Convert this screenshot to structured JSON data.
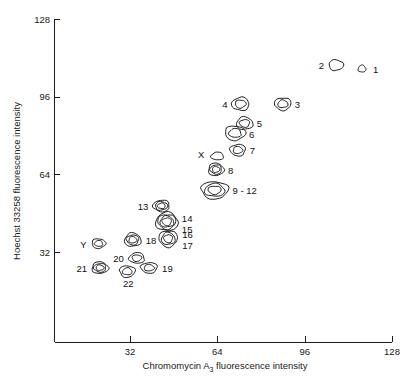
{
  "figure": {
    "kind": "bivariate-flow-karyotype",
    "background": "#ffffff",
    "ink_color": "#141414"
  },
  "chart_data": {
    "type": "scatter",
    "title": "",
    "subtitle": "",
    "xlabel_prefix": "Chromomycin A",
    "xlabel_sub": "3",
    "xlabel_suffix": " fluorescence intensity",
    "xlabel": "Chromomycin A3 fluorescence intensity",
    "ylabel": "Hoechst 33258 fluorescence intensity",
    "grid": false,
    "legend": "none",
    "xlim": [
      0,
      128
    ],
    "ylim": [
      0,
      128
    ],
    "xticks": [
      32,
      64,
      96,
      128
    ],
    "yticks": [
      32,
      64,
      96,
      128
    ],
    "xtick_labels": [
      "32",
      "64",
      "96",
      "128"
    ],
    "ytick_labels": [
      "32",
      "64",
      "96",
      "128"
    ],
    "x_axis_start_value": 5.5,
    "y_axis_start_value": 3.0,
    "point_encoding": "closed contour rings around each chromosome cluster peak",
    "points": [
      {
        "id": "1",
        "label": "1",
        "x": 117.0,
        "y": 107.5,
        "rings": 1,
        "rx": 4.0,
        "ry": 3.6,
        "label_dx": 11,
        "label_dy": 4,
        "label_anchor": "start"
      },
      {
        "id": "2",
        "label": "2",
        "x": 107.5,
        "y": 109.0,
        "rings": 1,
        "rx": 7.5,
        "ry": 5.5,
        "label_dx": -12,
        "label_dy": 4,
        "label_anchor": "end"
      },
      {
        "id": "3",
        "label": "3",
        "x": 88.0,
        "y": 93.0,
        "rings": 2,
        "rx": 8.5,
        "ry": 6.5,
        "label_dx": 12,
        "label_dy": 4,
        "label_anchor": "start"
      },
      {
        "id": "4",
        "label": "4",
        "x": 72.5,
        "y": 93.0,
        "rings": 2,
        "rx": 9.0,
        "ry": 6.8,
        "label_dx": -13,
        "label_dy": 4,
        "label_anchor": "end"
      },
      {
        "id": "5",
        "label": "5",
        "x": 74.0,
        "y": 85.0,
        "rings": 2,
        "rx": 8.5,
        "ry": 6.5,
        "label_dx": 12,
        "label_dy": 4,
        "label_anchor": "start"
      },
      {
        "id": "6",
        "label": "6",
        "x": 70.5,
        "y": 81.0,
        "rings": 2,
        "rx": 10.5,
        "ry": 7.5,
        "label_dx": 14,
        "label_dy": 5,
        "label_anchor": "start"
      },
      {
        "id": "7",
        "label": "7",
        "x": 71.5,
        "y": 74.0,
        "rings": 2,
        "rx": 8.0,
        "ry": 6.0,
        "label_dx": 12,
        "label_dy": 4,
        "label_anchor": "start"
      },
      {
        "id": "X",
        "label": "X",
        "x": 64.0,
        "y": 71.5,
        "rings": 1,
        "rx": 6.5,
        "ry": 4.0,
        "label_dx": -13,
        "label_dy": 2,
        "label_anchor": "end"
      },
      {
        "id": "8",
        "label": "8",
        "x": 63.5,
        "y": 66.0,
        "rings": 3,
        "rx": 8.0,
        "ry": 6.5,
        "label_dx": 12,
        "label_dy": 5,
        "label_anchor": "start"
      },
      {
        "id": "9-12",
        "label": "9 - 12",
        "x": 63.0,
        "y": 57.5,
        "rings": 3,
        "rx": 14.0,
        "ry": 9.0,
        "label_dx": 18,
        "label_dy": 4,
        "label_anchor": "start"
      },
      {
        "id": "13",
        "label": "13",
        "x": 43.5,
        "y": 51.0,
        "rings": 3,
        "rx": 8.5,
        "ry": 6.0,
        "label_dx": -13,
        "label_dy": 4,
        "label_anchor": "end"
      },
      {
        "id": "14",
        "label": "14",
        "x": 45.5,
        "y": 44.5,
        "rings": 4,
        "rx": 11.5,
        "ry": 9.5,
        "label_dx": 15,
        "label_dy": 0,
        "label_anchor": "start"
      },
      {
        "id": "15",
        "label": "15",
        "x": 45.5,
        "y": 44.5,
        "rings": 0,
        "rx": 0,
        "ry": 0,
        "label_dx": 15,
        "label_dy": 11,
        "label_anchor": "start"
      },
      {
        "id": "16",
        "label": "16",
        "x": 46.0,
        "y": 37.5,
        "rings": 3,
        "rx": 9.5,
        "ry": 8.5,
        "label_dx": 14,
        "label_dy": -1,
        "label_anchor": "start"
      },
      {
        "id": "17",
        "label": "17",
        "x": 46.0,
        "y": 37.5,
        "rings": 0,
        "rx": 0,
        "ry": 0,
        "label_dx": 14,
        "label_dy": 10,
        "label_anchor": "start"
      },
      {
        "id": "18",
        "label": "18",
        "x": 33.0,
        "y": 37.0,
        "rings": 3,
        "rx": 8.5,
        "ry": 7.0,
        "label_dx": 13,
        "label_dy": 4,
        "label_anchor": "start"
      },
      {
        "id": "Y",
        "label": "Y",
        "x": 20.5,
        "y": 35.5,
        "rings": 2,
        "rx": 7.0,
        "ry": 5.0,
        "label_dx": -12,
        "label_dy": 4,
        "label_anchor": "end"
      },
      {
        "id": "19",
        "label": "19",
        "x": 39.0,
        "y": 25.5,
        "rings": 2,
        "rx": 8.5,
        "ry": 5.5,
        "label_dx": 13,
        "label_dy": 4,
        "label_anchor": "start"
      },
      {
        "id": "20",
        "label": "20",
        "x": 34.5,
        "y": 29.5,
        "rings": 2,
        "rx": 8.0,
        "ry": 5.5,
        "label_dx": -13,
        "label_dy": 4,
        "label_anchor": "end"
      },
      {
        "id": "21",
        "label": "21",
        "x": 21.0,
        "y": 25.5,
        "rings": 3,
        "rx": 8.5,
        "ry": 6.0,
        "label_dx": -13,
        "label_dy": 4,
        "label_anchor": "end"
      },
      {
        "id": "22",
        "label": "22",
        "x": 31.0,
        "y": 24.0,
        "rings": 2,
        "rx": 8.0,
        "ry": 6.0,
        "label_dx": 1,
        "label_dy": 16,
        "label_anchor": "middle"
      }
    ],
    "annotations": [
      {
        "text": "9 - 12",
        "meaning": "merged cluster of chromosomes 9 through 12"
      },
      {
        "text": "X",
        "meaning": "X chromosome peak"
      },
      {
        "text": "Y",
        "meaning": "Y chromosome peak"
      }
    ]
  }
}
